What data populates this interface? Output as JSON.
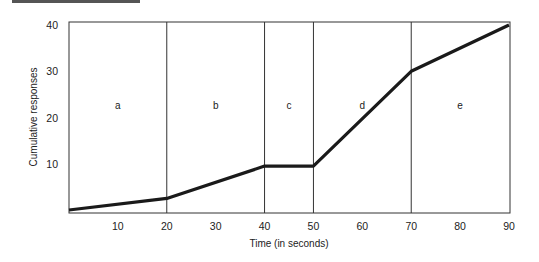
{
  "chart_data": {
    "type": "line",
    "title": "",
    "xlabel": "Time (in seconds)",
    "ylabel": "Cumulative responses",
    "x": [
      0,
      20,
      40,
      50,
      70,
      90
    ],
    "series": [
      {
        "name": "Cumulative responses",
        "values": [
          0,
          2.5,
          9.5,
          9.5,
          30,
          40
        ]
      }
    ],
    "xticks": [
      10,
      20,
      30,
      40,
      50,
      60,
      70,
      80,
      90
    ],
    "yticks": [
      10,
      20,
      30,
      40
    ],
    "xlim": [
      0,
      90
    ],
    "ylim": [
      0,
      40
    ],
    "grid": false,
    "segment_boundaries": [
      20,
      40,
      50,
      70
    ],
    "segments": [
      {
        "label": "a",
        "x_start": 0,
        "x_end": 20
      },
      {
        "label": "b",
        "x_start": 20,
        "x_end": 40
      },
      {
        "label": "c",
        "x_start": 40,
        "x_end": 50
      },
      {
        "label": "d",
        "x_start": 50,
        "x_end": 70
      },
      {
        "label": "e",
        "x_start": 70,
        "x_end": 90
      }
    ]
  },
  "labels": {
    "xlabel": "Time (in seconds)",
    "ylabel": "Cumulative responses",
    "xticks": [
      "10",
      "20",
      "30",
      "40",
      "50",
      "60",
      "70",
      "80",
      "90"
    ],
    "yticks": [
      "10",
      "20",
      "30",
      "40"
    ],
    "segments": [
      "a",
      "b",
      "c",
      "d",
      "e"
    ]
  }
}
